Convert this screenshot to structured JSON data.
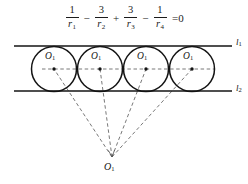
{
  "figure": {
    "width": 248,
    "height": 184,
    "background": "#ffffff",
    "stroke_color": "#141414",
    "dash_color": "#555555"
  },
  "formula": {
    "full_text": "1/r1 - 3/r2 + 3/r3 - 1/r4 = 0",
    "terms": [
      {
        "numerator": "1",
        "denominator_base": "r",
        "denominator_sub": "1"
      },
      {
        "numerator": "3",
        "denominator_base": "r",
        "denominator_sub": "2"
      },
      {
        "numerator": "3",
        "denominator_base": "r",
        "denominator_sub": "3"
      },
      {
        "numerator": "1",
        "denominator_base": "r",
        "denominator_sub": "4"
      }
    ],
    "operators": [
      "−",
      "+",
      "−"
    ],
    "equals": "=",
    "right_hand_side": "0"
  },
  "diagram": {
    "lines": [
      {
        "id": "upper-line",
        "label_base": "l",
        "label_sub": "1",
        "y": 46,
        "x_start": 14,
        "x_end": 232,
        "label_x": 236,
        "label_y": 40
      },
      {
        "id": "lower-line",
        "label_base": "l",
        "label_sub": "2",
        "y": 91,
        "x_start": 14,
        "x_end": 232,
        "label_x": 236,
        "label_y": 86
      }
    ],
    "circles": [
      {
        "id": "circle-1",
        "cx": 54,
        "cy": 69,
        "r": 22.5,
        "label_base": "O",
        "label_sub": "1",
        "label_x": 45,
        "label_y": 58
      },
      {
        "id": "circle-2",
        "cx": 100,
        "cy": 69,
        "r": 22.5,
        "label_base": "O",
        "label_sub": "1",
        "label_x": 91,
        "label_y": 58
      },
      {
        "id": "circle-3",
        "cx": 146,
        "cy": 69,
        "r": 22.5,
        "label_base": "O",
        "label_sub": "1",
        "label_x": 137,
        "label_y": 58
      },
      {
        "id": "circle-4",
        "cx": 192,
        "cy": 69,
        "r": 22.5,
        "label_base": "O",
        "label_sub": "1",
        "label_x": 183,
        "label_y": 58
      }
    ],
    "center_axis": {
      "y": 69,
      "x_start": 42,
      "x_end": 215
    },
    "apex": {
      "id": "apex-point",
      "x": 112,
      "y": 157,
      "label_base": "O",
      "label_sub": "1",
      "label_x": 105,
      "label_y": 162
    }
  }
}
